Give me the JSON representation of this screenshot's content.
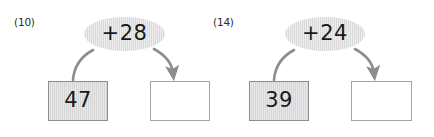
{
  "worksheet": {
    "background_color": "#ffffff",
    "bubble_fill_color": "#d9d9d9",
    "filled_box_color": "#d6d6d6",
    "filled_box_border_color": "#8d8d8d",
    "empty_box_border_color": "#a3a3a3",
    "connector_color": "#8d8d8d",
    "text_color": "#1a1a1a"
  },
  "problems": [
    {
      "label": "(10)",
      "operation": "+28",
      "start_value": "47",
      "answer_value": "",
      "input_connector_name": "curve-from-start-box-to-operation",
      "output_connector_name": "arrow-from-operation-to-answer-box"
    },
    {
      "label": "(14)",
      "operation": "+24",
      "start_value": "39",
      "answer_value": "",
      "input_connector_name": "curve-from-start-box-to-operation",
      "output_connector_name": "arrow-from-operation-to-answer-box"
    }
  ]
}
